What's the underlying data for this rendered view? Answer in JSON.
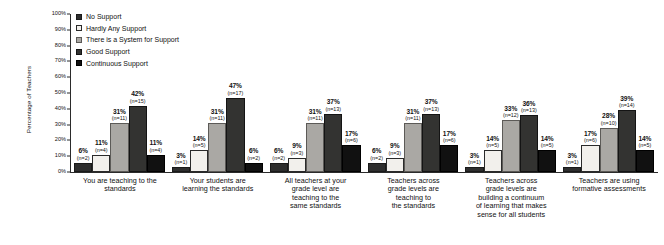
{
  "chart_data": {
    "type": "bar",
    "title": "",
    "xlabel": "",
    "ylabel": "Percentage of Teachers",
    "ylim": [
      0,
      100
    ],
    "grid": false,
    "legend_position": "top-left",
    "ytick_labels": [
      "100%",
      "90%",
      "80%",
      "70%",
      "60%",
      "50%",
      "40%",
      "30%",
      "20%",
      "10%",
      "0%"
    ],
    "ytick_values": [
      100,
      90,
      80,
      70,
      60,
      50,
      40,
      30,
      20,
      10,
      0
    ],
    "categories": [
      "You are teaching to the standards",
      "Your students are learning the standards",
      "All teachers at your grade level are teaching to the same standards",
      "Teachers across grade levels are teaching to the standards",
      "Teachers across grade levels are building a continuum of learning that makes sense for all students",
      "Teachers are using formative assessments"
    ],
    "series": [
      {
        "name": "No Support",
        "key": "no",
        "color": "#2e2e2e",
        "values": [
          6,
          3,
          6,
          6,
          3,
          3
        ],
        "counts": [
          2,
          1,
          2,
          2,
          1,
          1
        ],
        "labels": [
          "6%",
          "3%",
          "6%",
          "6%",
          "3%",
          "3%"
        ],
        "count_labels": [
          "(n=2)",
          "(n=1)",
          "(n=2)",
          "(n=2)",
          "(n=1)",
          "(n=1)"
        ]
      },
      {
        "name": "Hardly Any Support",
        "key": "hardly",
        "color": "#f2f0ec",
        "values": [
          11,
          14,
          9,
          9,
          14,
          17
        ],
        "counts": [
          4,
          5,
          3,
          3,
          5,
          6
        ],
        "labels": [
          "11%",
          "14%",
          "9%",
          "9%",
          "14%",
          "17%"
        ],
        "count_labels": [
          "(n=4)",
          "(n=5)",
          "(n=3)",
          "(n=3)",
          "(n=5)",
          "(n=6)"
        ]
      },
      {
        "name": "There is a System for Support",
        "key": "system",
        "color": "#aaa8a4",
        "values": [
          31,
          31,
          31,
          31,
          33,
          28
        ],
        "counts": [
          11,
          11,
          11,
          11,
          12,
          10
        ],
        "labels": [
          "31%",
          "31%",
          "31%",
          "31%",
          "33%",
          "28%"
        ],
        "count_labels": [
          "(n=11)",
          "(n=11)",
          "(n=11)",
          "(n=11)",
          "(n=12)",
          "(n=10)"
        ]
      },
      {
        "name": "Good Support",
        "key": "good",
        "color": "#333331",
        "values": [
          42,
          47,
          37,
          37,
          36,
          39
        ],
        "counts": [
          15,
          17,
          13,
          13,
          13,
          14
        ],
        "labels": [
          "42%",
          "47%",
          "37%",
          "37%",
          "36%",
          "39%"
        ],
        "count_labels": [
          "(n=15)",
          "(n=17)",
          "(n=13)",
          "(n=13)",
          "(n=13)",
          "(n=14)"
        ]
      },
      {
        "name": "Continuous Support",
        "key": "cont",
        "color": "#111111",
        "values": [
          11,
          6,
          17,
          17,
          14,
          14
        ],
        "counts": [
          4,
          2,
          6,
          6,
          5,
          5
        ],
        "labels": [
          "11%",
          "6%",
          "17%",
          "17%",
          "14%",
          "14%"
        ],
        "count_labels": [
          "(n=4)",
          "(n=2)",
          "(n=6)",
          "(n=6)",
          "(n=5)",
          "(n=5)"
        ]
      }
    ]
  },
  "legend": {
    "items": [
      {
        "label": "No Support",
        "key": "no"
      },
      {
        "label": "Hardly Any Support",
        "key": "hardly"
      },
      {
        "label": "There is a System for Support",
        "key": "system"
      },
      {
        "label": "Good Support",
        "key": "good"
      },
      {
        "label": "Continuous Support",
        "key": "cont"
      }
    ]
  },
  "xlabels": [
    [
      "You are teaching to the",
      "standards"
    ],
    [
      "Your students are",
      "learning the standards"
    ],
    [
      "All teachers at your",
      "grade level are",
      "teaching to the",
      "same standards"
    ],
    [
      "Teachers across",
      "grade levels are",
      "teaching to",
      "the standards"
    ],
    [
      "Teachers across",
      "grade levels are",
      "building a continuum",
      "of learning that makes",
      "sense for all students"
    ],
    [
      "Teachers are using",
      "formative assessments"
    ]
  ]
}
